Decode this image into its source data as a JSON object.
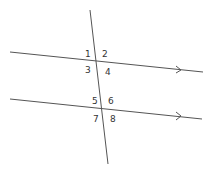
{
  "diagram": {
    "lines": [
      {
        "name": "parallel-line-top",
        "has_arrow": true
      },
      {
        "name": "parallel-line-bottom",
        "has_arrow": true
      },
      {
        "name": "transversal",
        "has_arrow": false
      }
    ],
    "angle_labels": [
      "1",
      "2",
      "3",
      "4",
      "5",
      "6",
      "7",
      "8"
    ]
  }
}
